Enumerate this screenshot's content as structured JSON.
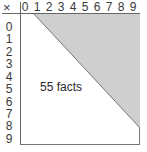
{
  "table": {
    "operator": "×",
    "columns": [
      "0",
      "1",
      "2",
      "3",
      "4",
      "5",
      "6",
      "7",
      "8",
      "9"
    ],
    "rows": [
      "0",
      "1",
      "2",
      "3",
      "4",
      "5",
      "6",
      "7",
      "8",
      "9"
    ]
  },
  "annotation": "55 facts",
  "colors": {
    "shaded_region": "#cfcfcf",
    "line": "#666666",
    "text": "#3a3a3a"
  }
}
